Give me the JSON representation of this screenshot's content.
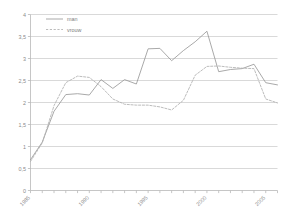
{
  "chart_data": {
    "type": "line",
    "title": "",
    "xlabel": "",
    "ylabel": "",
    "xlim": [
      1985,
      2006
    ],
    "ylim": [
      0,
      4
    ],
    "grid": true,
    "legend_position": "top-left",
    "y_ticks": [
      "0",
      "0,5",
      "1",
      "1,5",
      "2",
      "2,5",
      "3",
      "3,5",
      "4"
    ],
    "y_tick_values": [
      0,
      0.5,
      1,
      1.5,
      2,
      2.5,
      3,
      3.5,
      4
    ],
    "x_ticks": [
      "1985",
      "1990",
      "1995",
      "2000",
      "2005"
    ],
    "x_tick_values": [
      1985,
      1990,
      1995,
      2000,
      2005
    ],
    "x": [
      1985,
      1986,
      1987,
      1988,
      1989,
      1990,
      1991,
      1992,
      1993,
      1994,
      1995,
      1996,
      1997,
      1998,
      1999,
      2000,
      2001,
      2002,
      2003,
      2004,
      2005,
      2006
    ],
    "series": [
      {
        "name": "man",
        "style": "solid",
        "color": "#9a9a9a",
        "values": [
          0.7,
          1.1,
          1.8,
          2.18,
          2.2,
          2.17,
          2.52,
          2.32,
          2.52,
          2.42,
          3.22,
          3.23,
          2.95,
          3.18,
          3.38,
          3.62,
          2.7,
          2.75,
          2.77,
          2.87,
          2.45,
          2.4
        ]
      },
      {
        "name": "vrouw",
        "style": "dotted",
        "color": "#b0b0b0",
        "values": [
          0.66,
          1.08,
          1.93,
          2.45,
          2.6,
          2.57,
          2.36,
          2.08,
          1.96,
          1.94,
          1.94,
          1.9,
          1.83,
          2.05,
          2.62,
          2.82,
          2.83,
          2.8,
          2.78,
          2.77,
          2.08,
          1.99
        ]
      }
    ]
  },
  "legend": {
    "items": [
      {
        "label": "man"
      },
      {
        "label": "vrouw"
      }
    ]
  },
  "axes": {
    "y_axis_name": "value-axis",
    "x_axis_name": "year-axis"
  }
}
